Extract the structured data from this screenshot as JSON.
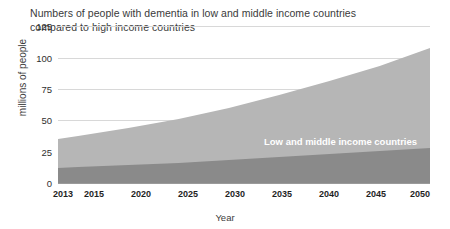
{
  "chart_data": {
    "type": "area",
    "stacked": true,
    "title": "Numbers of people with dementia in low and middle income countries\ncompared to high income countries",
    "xlabel": "Year",
    "ylabel": "millions of people",
    "x": [
      2013,
      2015,
      2020,
      2025,
      2030,
      2035,
      2040,
      2045,
      2050
    ],
    "xtick_labels": [
      "2013",
      "2015",
      "2020",
      "2025",
      "2030",
      "2035",
      "2040",
      "2045",
      "2050"
    ],
    "ytick_labels": [
      "0",
      "25",
      "50",
      "75",
      "100",
      "125"
    ],
    "yticks": [
      0,
      25,
      50,
      75,
      100,
      125
    ],
    "ylim": [
      0,
      158
    ],
    "xlim": [
      2013,
      2050
    ],
    "grid": true,
    "legend": "inline-labels",
    "series": [
      {
        "name": "High income countries",
        "color": "#8a8a8a",
        "values": [
          15,
          16,
          18,
          20,
          23,
          26,
          29,
          32,
          35
        ]
      },
      {
        "name": "Low and middle income countries",
        "color": "#b6b6b6",
        "values": [
          29,
          31,
          37,
          44,
          52,
          62,
          73,
          85,
          100
        ]
      }
    ],
    "totals": [
      44,
      47,
      55,
      64,
      75,
      88,
      102,
      117,
      135
    ],
    "annotations": [
      {
        "text": "Low and middle income countries",
        "color": "#ffffff"
      },
      {
        "text": "High income countries",
        "color": "#ffffff"
      }
    ]
  },
  "colors": {
    "low_middle": "#b6b6b6",
    "high_income": "#8a8a8a",
    "grid": "#d8d8d8",
    "axis": "#9a9a9a",
    "title_text": "#3a3a3a",
    "tick_text": "#1f1f1f",
    "background": "#ffffff"
  }
}
